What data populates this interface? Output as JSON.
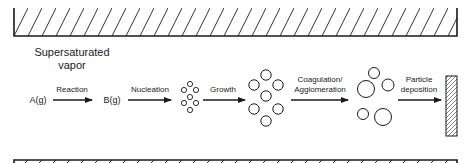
{
  "diagram": {
    "title_line1": "Supersaturated",
    "title_line2": "vapor",
    "species": {
      "reactant": "A(g)",
      "product": "B(g)"
    },
    "steps": [
      {
        "label": "Reaction"
      },
      {
        "label": "Nucleation"
      },
      {
        "label": "Growth"
      },
      {
        "label_line1": "Coagulation/",
        "label_line2": "Agglomeration"
      },
      {
        "label_line1": "Particle",
        "label_line2": "deposition"
      }
    ],
    "colors": {
      "stroke": "#1a1a1a",
      "background": "#ffffff"
    }
  }
}
